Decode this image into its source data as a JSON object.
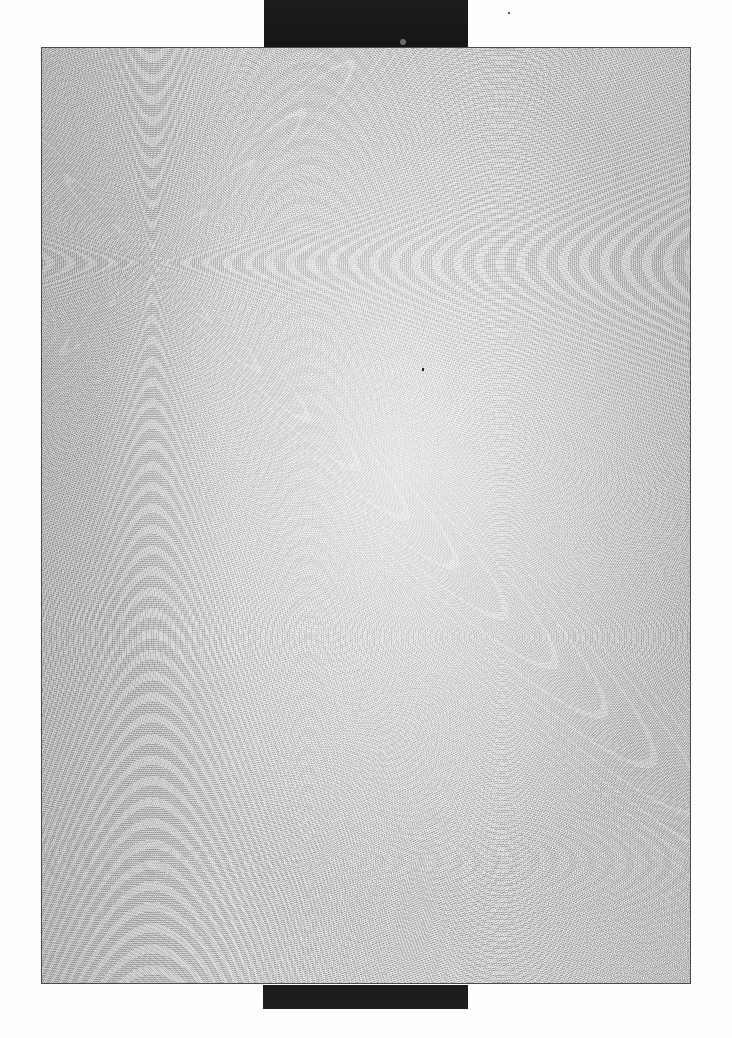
{
  "scene": {
    "description": "Scanned blank sheet",
    "background_color": "#fefefe",
    "sheet": {
      "fill_color": "#d8d8d8",
      "border_color": "#4a4a4a",
      "texture": "grain-noise",
      "content_text": ""
    },
    "top_bar": {
      "color": "#1c1c1c"
    },
    "bottom_bar": {
      "color": "#1a1a1a"
    }
  }
}
